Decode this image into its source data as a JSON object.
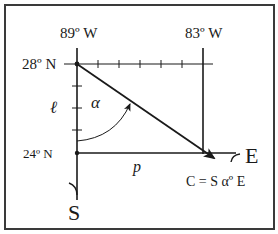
{
  "diagram": {
    "title": "",
    "labels": {
      "lon_left": "89º W",
      "lon_right": "83º W",
      "lat_top": "28º N",
      "lat_bottom": "24º N",
      "side_l": "ℓ",
      "side_p": "p",
      "angle": "α",
      "east": "E",
      "south": "S",
      "course_formula": "C = S αº E"
    },
    "colors": {
      "line": "#1a1a1a",
      "frame": "#3a3a3a",
      "background": "#ffffff"
    },
    "geometry": {
      "top_ticks": 5,
      "left_ticks": 3
    }
  }
}
